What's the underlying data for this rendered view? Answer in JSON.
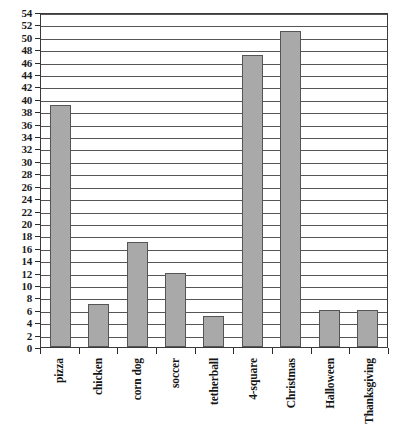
{
  "chart_data": {
    "type": "bar",
    "title": "",
    "subtitle": "",
    "xlabel": "",
    "ylabel": "",
    "categories": [
      "pizza",
      "chicken",
      "corn dog",
      "soccer",
      "tetherball",
      "4-square",
      "Christmas",
      "Halloween",
      "Thanksgiving"
    ],
    "values": [
      39,
      7,
      17,
      12,
      5,
      47,
      51,
      6,
      6
    ],
    "ylim": [
      0,
      54
    ],
    "ytick_step": 2,
    "yticks": [
      0,
      2,
      4,
      6,
      8,
      10,
      12,
      14,
      16,
      18,
      20,
      22,
      24,
      26,
      28,
      30,
      32,
      34,
      36,
      38,
      40,
      42,
      44,
      46,
      48,
      50,
      52,
      54
    ],
    "ytick_labels": [
      "0",
      "2",
      "4",
      "6",
      "8",
      "10",
      "12",
      "14",
      "16",
      "18",
      "20",
      "22",
      "24",
      "26",
      "28",
      "30",
      "32",
      "34",
      "36",
      "38",
      "40",
      "42",
      "44",
      "46",
      "48",
      "50",
      "52",
      "54"
    ],
    "grid": true,
    "grid_axis": "y",
    "legend": false,
    "legend_position": "none",
    "xtick_label_rotation": 90,
    "bar_color": "#a9a9a9",
    "bar_edge_color": "#555555",
    "grid_color": "#555555",
    "axis_color": "#3a3a3a",
    "background_color": "#ffffff"
  }
}
